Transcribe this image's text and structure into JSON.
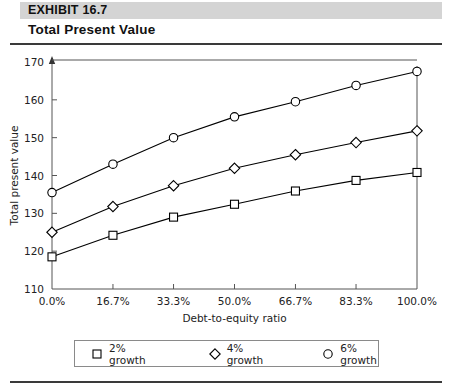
{
  "exhibit": {
    "label": "EXHIBIT 16.7",
    "title": "Total Present Value"
  },
  "chart_data": {
    "type": "line",
    "title": "Total Present Value",
    "xlabel": "Debt-to-equity ratio",
    "ylabel": "Total present value",
    "categories": [
      "0.0%",
      "16.7%",
      "33.3%",
      "50.0%",
      "66.7%",
      "83.3%",
      "100.0%"
    ],
    "x": [
      0,
      16.7,
      33.3,
      50.0,
      66.7,
      83.3,
      100.0
    ],
    "xlim": [
      0,
      100
    ],
    "ylim": [
      110,
      170
    ],
    "yticks": [
      110,
      120,
      130,
      140,
      150,
      160,
      170
    ],
    "grid": false,
    "legend_position": "bottom",
    "series": [
      {
        "name": "2% growth",
        "marker": "square",
        "values": [
          118.5,
          124.2,
          129.0,
          132.4,
          135.9,
          138.7,
          140.8
        ]
      },
      {
        "name": "4% growth",
        "marker": "diamond",
        "values": [
          125.0,
          131.8,
          137.3,
          141.9,
          145.5,
          148.7,
          151.8
        ]
      },
      {
        "name": "6% growth",
        "marker": "circle",
        "values": [
          135.5,
          143.0,
          150.0,
          155.5,
          159.5,
          163.8,
          167.5
        ]
      }
    ]
  },
  "legend": {
    "items": [
      {
        "label": "2% growth",
        "marker": "square"
      },
      {
        "label": "4% growth",
        "marker": "diamond"
      },
      {
        "label": "6% growth",
        "marker": "circle"
      }
    ]
  },
  "colors": {
    "band": "#d4d4d4",
    "rule": "#3a3a3a",
    "axis": "#555555",
    "line": "#000000"
  }
}
